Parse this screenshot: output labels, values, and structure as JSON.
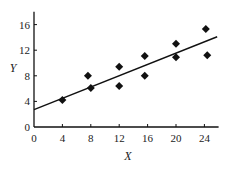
{
  "chart_data": {
    "type": "scatter",
    "title": "",
    "xlabel": "X",
    "ylabel": "Y",
    "xlim": [
      0,
      26
    ],
    "ylim": [
      0,
      18
    ],
    "x_ticks": [
      0,
      4,
      8,
      12,
      16,
      20,
      24
    ],
    "y_ticks": [
      0,
      4,
      8,
      12,
      16
    ],
    "grid": false,
    "legend": null,
    "series": [
      {
        "name": "data",
        "marker": "diamond",
        "points": [
          {
            "x": 4,
            "y": 4.2
          },
          {
            "x": 7.6,
            "y": 8
          },
          {
            "x": 8,
            "y": 6.1
          },
          {
            "x": 12,
            "y": 9.4
          },
          {
            "x": 12,
            "y": 6.4
          },
          {
            "x": 15.6,
            "y": 11.1
          },
          {
            "x": 15.6,
            "y": 8
          },
          {
            "x": 20,
            "y": 13
          },
          {
            "x": 20,
            "y": 10.9
          },
          {
            "x": 24.2,
            "y": 15.3
          },
          {
            "x": 24.4,
            "y": 11.2
          }
        ]
      },
      {
        "name": "fitted line",
        "type": "line",
        "points": [
          {
            "x": 0,
            "y": 2.7
          },
          {
            "x": 25.8,
            "y": 14.1
          }
        ]
      }
    ]
  },
  "labels": {
    "x_axis": "X",
    "y_axis": "Y",
    "x_ticks": [
      "0",
      "4",
      "8",
      "12",
      "16",
      "20",
      "24"
    ],
    "y_ticks": [
      "0",
      "4",
      "8",
      "12",
      "16"
    ]
  },
  "colors": {
    "ink": "#111111",
    "background": "#ffffff"
  }
}
